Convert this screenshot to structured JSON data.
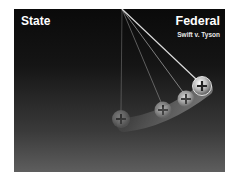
{
  "slide": {
    "left_label": "State",
    "right_label": "Federal",
    "subtitle": "Swift v. Tyson"
  },
  "graphic": {
    "type": "pendulum",
    "description": "Newton's-cradle style pendulum swinging from State toward Federal",
    "pivot": [
      108,
      0
    ],
    "balls": [
      {
        "cx": 107,
        "cy": 110,
        "opacity": 0.35
      },
      {
        "cx": 149,
        "cy": 101,
        "opacity": 0.55
      },
      {
        "cx": 172,
        "cy": 90,
        "opacity": 0.75
      },
      {
        "cx": 188,
        "cy": 77,
        "opacity": 1.0
      }
    ]
  },
  "colors": {
    "background": "#ffffff",
    "panel_top": "#0a0a0a",
    "panel_bottom": "#5e5e5e",
    "text": "#ffffff"
  }
}
